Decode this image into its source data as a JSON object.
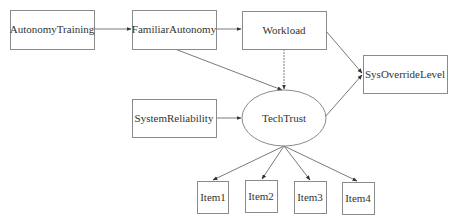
{
  "diagram": {
    "type": "path-diagram",
    "nodes": [
      {
        "id": "AutonomyTraining",
        "label": "AutonomyTraining",
        "shape": "rect",
        "x": 10,
        "y": 10,
        "w": 84,
        "h": 39
      },
      {
        "id": "FamiliarAutonomy",
        "label": "FamiliarAutonomy",
        "shape": "rect",
        "x": 132,
        "y": 10,
        "w": 84,
        "h": 39
      },
      {
        "id": "Workload",
        "label": "Workload",
        "shape": "rect",
        "x": 242,
        "y": 11,
        "w": 84,
        "h": 38
      },
      {
        "id": "SysOverrideLevel",
        "label": "SysOverrideLevel",
        "shape": "rect",
        "x": 363,
        "y": 55,
        "w": 84,
        "h": 38
      },
      {
        "id": "SystemReliability",
        "label": "SystemReliability",
        "shape": "rect",
        "x": 132,
        "y": 99,
        "w": 84,
        "h": 38
      },
      {
        "id": "TechTrust",
        "label": "TechTrust",
        "shape": "ellipse",
        "cx": 284,
        "cy": 118,
        "rx": 42,
        "ry": 28
      },
      {
        "id": "Item1",
        "label": "Item1",
        "shape": "rect",
        "x": 197,
        "y": 181,
        "w": 32,
        "h": 32
      },
      {
        "id": "Item2",
        "label": "Item2",
        "shape": "rect",
        "x": 245,
        "y": 180,
        "w": 32,
        "h": 32
      },
      {
        "id": "Item3",
        "label": "Item3",
        "shape": "rect",
        "x": 294,
        "y": 181,
        "w": 32,
        "h": 32
      },
      {
        "id": "Item4",
        "label": "Item4",
        "shape": "rect",
        "x": 342,
        "y": 182,
        "w": 32,
        "h": 32
      }
    ],
    "edges": [
      {
        "from": "AutonomyTraining",
        "to": "FamiliarAutonomy"
      },
      {
        "from": "FamiliarAutonomy",
        "to": "Workload"
      },
      {
        "from": "FamiliarAutonomy",
        "to": "TechTrust"
      },
      {
        "from": "Workload",
        "to": "TechTrust",
        "style": "dotted"
      },
      {
        "from": "Workload",
        "to": "SysOverrideLevel"
      },
      {
        "from": "SystemReliability",
        "to": "TechTrust"
      },
      {
        "from": "TechTrust",
        "to": "SysOverrideLevel"
      },
      {
        "from": "TechTrust",
        "to": "Item1"
      },
      {
        "from": "TechTrust",
        "to": "Item2"
      },
      {
        "from": "TechTrust",
        "to": "Item3"
      },
      {
        "from": "TechTrust",
        "to": "Item4"
      }
    ]
  }
}
